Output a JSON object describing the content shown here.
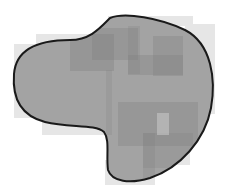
{
  "canvas": {
    "width": 225,
    "height": 191,
    "background": "#ffffff"
  },
  "blob": {
    "fill": "#a3a3a3",
    "stroke": "#1a1a1a",
    "stroke_width": 2,
    "path": "M 110 18 C 125 12, 160 18, 185 30 C 212 44, 216 80, 211 108 C 205 140, 180 168, 150 178 C 130 184, 112 182, 108 170 C 106 155, 110 140, 104 132 C 95 124, 70 128, 45 122 C 22 116, 12 100, 14 74 C 16 48, 40 40, 70 40 C 90 40, 100 28, 110 18 Z"
  },
  "outer_rects": [
    {
      "x": 14,
      "y": 44,
      "w": 24,
      "h": 74,
      "color": "#e6e6e6",
      "opacity": 1
    },
    {
      "x": 36,
      "y": 34,
      "w": 75,
      "h": 10,
      "color": "#e6e6e6",
      "opacity": 1
    },
    {
      "x": 42,
      "y": 118,
      "w": 70,
      "h": 17,
      "color": "#e6e6e6",
      "opacity": 1
    },
    {
      "x": 108,
      "y": 16,
      "w": 85,
      "h": 10,
      "color": "#e6e6e6",
      "opacity": 1
    },
    {
      "x": 185,
      "y": 24,
      "w": 30,
      "h": 90,
      "color": "#e6e6e6",
      "opacity": 1
    },
    {
      "x": 105,
      "y": 160,
      "w": 50,
      "h": 25,
      "color": "#e6e6e6",
      "opacity": 1
    },
    {
      "x": 150,
      "y": 140,
      "w": 40,
      "h": 25,
      "color": "#e6e6e6",
      "opacity": 1
    }
  ],
  "inner_rects": [
    {
      "x": 70,
      "y": 34,
      "w": 44,
      "h": 37,
      "color": "#7f7f7f",
      "opacity": 0.35
    },
    {
      "x": 92,
      "y": 28,
      "w": 46,
      "h": 32,
      "color": "#7f7f7f",
      "opacity": 0.3
    },
    {
      "x": 128,
      "y": 26,
      "w": 12,
      "h": 48,
      "color": "#7f7f7f",
      "opacity": 0.25
    },
    {
      "x": 128,
      "y": 55,
      "w": 55,
      "h": 20,
      "color": "#7f7f7f",
      "opacity": 0.3
    },
    {
      "x": 153,
      "y": 36,
      "w": 30,
      "h": 40,
      "color": "#7f7f7f",
      "opacity": 0.3
    },
    {
      "x": 106,
      "y": 70,
      "w": 6,
      "h": 65,
      "color": "#7f7f7f",
      "opacity": 0.2
    },
    {
      "x": 118,
      "y": 102,
      "w": 80,
      "h": 44,
      "color": "#7f7f7f",
      "opacity": 0.3
    },
    {
      "x": 143,
      "y": 133,
      "w": 50,
      "h": 35,
      "color": "#7f7f7f",
      "opacity": 0.25
    },
    {
      "x": 143,
      "y": 133,
      "w": 12,
      "h": 45,
      "color": "#7f7f7f",
      "opacity": 0.25
    },
    {
      "x": 157,
      "y": 113,
      "w": 12,
      "h": 22,
      "color": "#d0d0d0",
      "opacity": 0.5
    }
  ]
}
